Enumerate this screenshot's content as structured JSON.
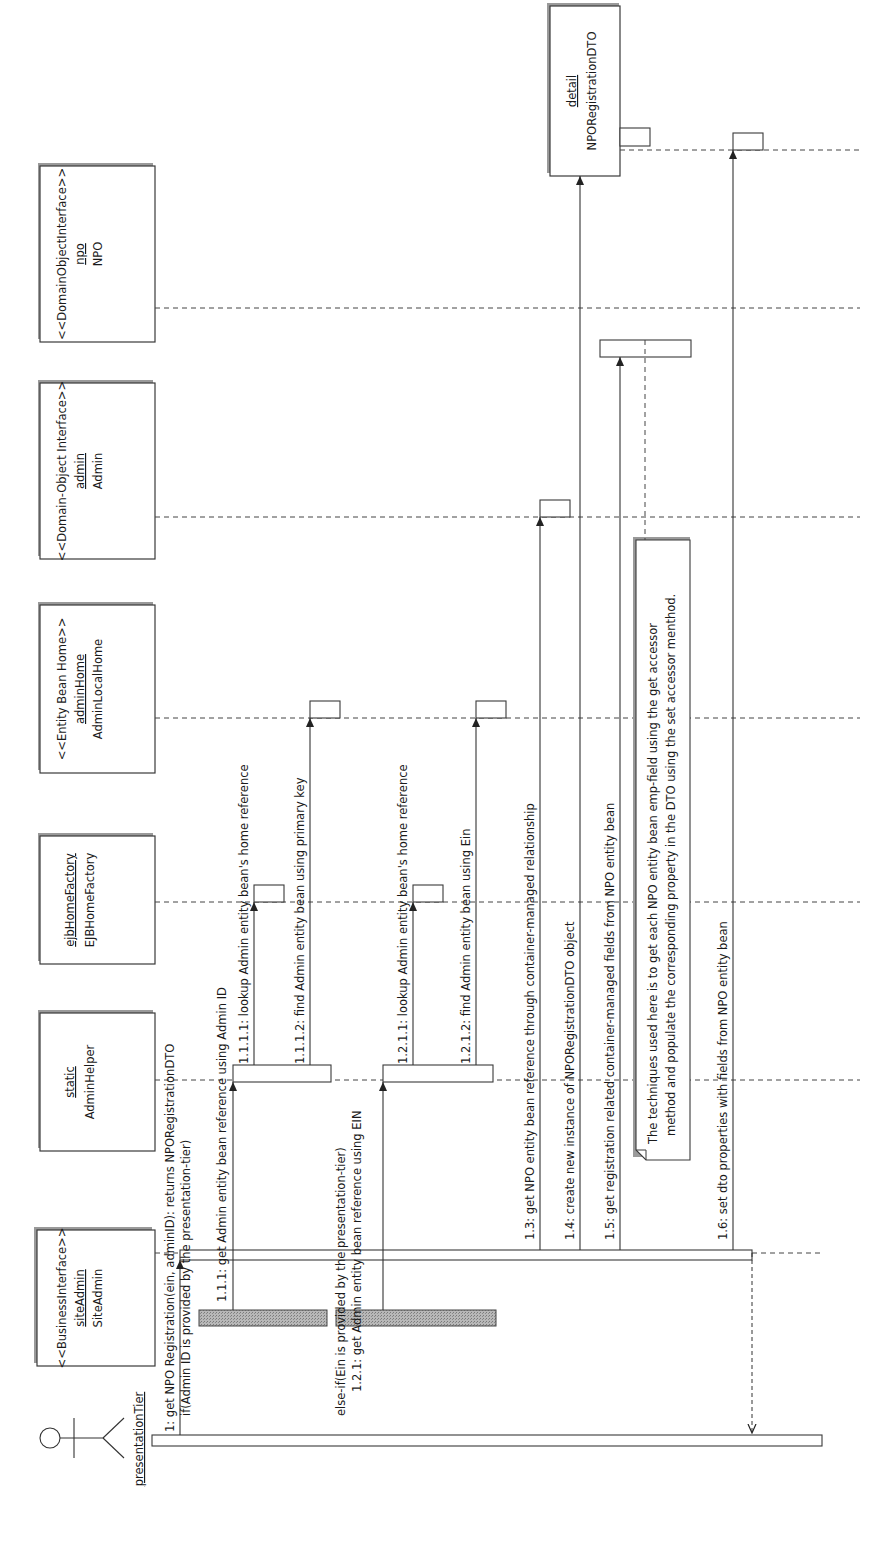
{
  "diagram": {
    "type": "UML sequence diagram",
    "orientation": "rotated 90 degrees counter-clockwise",
    "actor": {
      "name": "presentationTier"
    },
    "participants": [
      {
        "id": "siteAdmin",
        "stereotype": "<<BusinessInterface>>",
        "instance": "siteAdmin",
        "class": "SiteAdmin"
      },
      {
        "id": "adminHelper",
        "stereotype": "",
        "instance": "static",
        "class": "AdminHelper"
      },
      {
        "id": "ejbHomeFactory",
        "stereotype": "",
        "instance": "ejbHomeFactory",
        "class": "EJBHomeFactory"
      },
      {
        "id": "adminHome",
        "stereotype": "<<Entity Bean Home>>",
        "instance": "adminHome",
        "class": "AdminLocalHome"
      },
      {
        "id": "admin",
        "stereotype": "<<Domain-Object Interface>>",
        "instance": "admin",
        "class": "Admin"
      },
      {
        "id": "npo",
        "stereotype": "<<DomainObjectInterface>>",
        "instance": "npo",
        "class": "NPO"
      },
      {
        "id": "detail",
        "stereotype": "",
        "instance": "detail",
        "class": "NPORegistrationDTO"
      }
    ],
    "messages": [
      {
        "seq": "1",
        "label": "1: get NPO Registration(ein, adminID): returns NPORegistrationDTO",
        "from": "presentationTier",
        "to": "siteAdmin"
      },
      {
        "seq": "guard1",
        "label": "if(Admin ID is provided by the presentation-tier)"
      },
      {
        "seq": "1.1.1",
        "label": "1.1.1: get Admin entity bean reference using Admin ID",
        "from": "siteAdmin",
        "to": "adminHelper"
      },
      {
        "seq": "1.1.1.1",
        "label": "1.1.1.1: lookup Admin entity bean's home reference",
        "from": "adminHelper",
        "to": "ejbHomeFactory"
      },
      {
        "seq": "1.1.1.2",
        "label": "1.1.1.2: find Admin entity bean using primary key",
        "from": "adminHelper",
        "to": "adminHome"
      },
      {
        "seq": "guard2",
        "label": "else-if(Ein is provided by the presentation-tier)"
      },
      {
        "seq": "1.2.1",
        "label": "1.2.1: get Admin entity bean reference using EIN",
        "from": "siteAdmin",
        "to": "adminHelper"
      },
      {
        "seq": "1.2.1.1",
        "label": "1.2.1.1: lookup Admin entity bean's home reference",
        "from": "adminHelper",
        "to": "ejbHomeFactory"
      },
      {
        "seq": "1.2.1.2",
        "label": "1.2.1.2: find Admin  entity bean using Ein",
        "from": "adminHelper",
        "to": "adminHome"
      },
      {
        "seq": "1.3",
        "label": "1.3: get NPO entity bean reference through container-managed relationship",
        "from": "siteAdmin",
        "to": "admin"
      },
      {
        "seq": "1.4",
        "label": "1.4: create new instance of NPORegistrationDTO object",
        "from": "siteAdmin",
        "to": "detail"
      },
      {
        "seq": "1.5",
        "label": "1.5: get registration related container-managed fields from NPO entity bean",
        "from": "siteAdmin",
        "to": "npo"
      },
      {
        "seq": "1.6",
        "label": "1.6: set dto properties with fields from NPO entity bean",
        "from": "siteAdmin",
        "to": "detail"
      }
    ],
    "note": {
      "line1": "The techniques used here is to get each NPO entity bean emp-field using the get  accessor",
      "line2": "method and populate the corresponding property in the DTO using the set accessor menthod."
    },
    "colors": {
      "line": "#333333",
      "shadow": "#9a9a9a",
      "background": "#ffffff"
    }
  }
}
